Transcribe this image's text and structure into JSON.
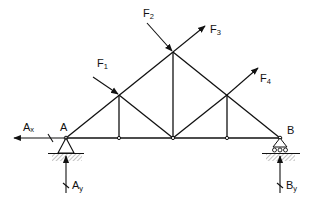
{
  "diagram": {
    "type": "truss-free-body-diagram",
    "nodes": {
      "A": {
        "label": "A",
        "x": 66,
        "y": 138
      },
      "B": {
        "label": "B",
        "x": 280,
        "y": 138
      },
      "C": {
        "x": 119,
        "y": 138
      },
      "D": {
        "x": 173,
        "y": 138
      },
      "E": {
        "x": 227,
        "y": 138
      },
      "F": {
        "x": 119,
        "y": 95
      },
      "G": {
        "x": 173,
        "y": 52
      },
      "H": {
        "x": 227,
        "y": 95
      }
    },
    "members": [
      [
        "A",
        "C"
      ],
      [
        "C",
        "D"
      ],
      [
        "D",
        "E"
      ],
      [
        "E",
        "B"
      ],
      [
        "A",
        "F"
      ],
      [
        "F",
        "G"
      ],
      [
        "G",
        "H"
      ],
      [
        "H",
        "B"
      ],
      [
        "F",
        "C"
      ],
      [
        "G",
        "D"
      ],
      [
        "H",
        "E"
      ],
      [
        "A",
        "F"
      ],
      [
        "F",
        "D"
      ],
      [
        "H",
        "D"
      ]
    ],
    "supports": {
      "A": {
        "type": "pin",
        "label": "A"
      },
      "B": {
        "type": "roller",
        "label": "B"
      }
    },
    "loads": [
      {
        "name": "F1",
        "main": "F",
        "sub": "1",
        "at": "F",
        "direction": "toward joint (down-right)"
      },
      {
        "name": "F2",
        "main": "F",
        "sub": "2",
        "at": "G",
        "direction": "toward joint (down-right)"
      },
      {
        "name": "F3",
        "main": "F",
        "sub": "3",
        "at": "G",
        "direction": "away from joint (up-right)"
      },
      {
        "name": "F4",
        "main": "F",
        "sub": "4",
        "at": "H",
        "direction": "away from joint (up-right)"
      }
    ],
    "reactions": [
      {
        "name": "Ax",
        "main": "A",
        "sub": "x",
        "at": "A",
        "direction": "left"
      },
      {
        "name": "Ay",
        "main": "A",
        "sub": "y",
        "at": "A",
        "direction": "up"
      },
      {
        "name": "By",
        "main": "B",
        "sub": "y",
        "at": "B",
        "direction": "up"
      }
    ],
    "colors": {
      "line": "#111111",
      "ground_hatch": "#9a9a9a",
      "background": "#ffffff"
    }
  }
}
